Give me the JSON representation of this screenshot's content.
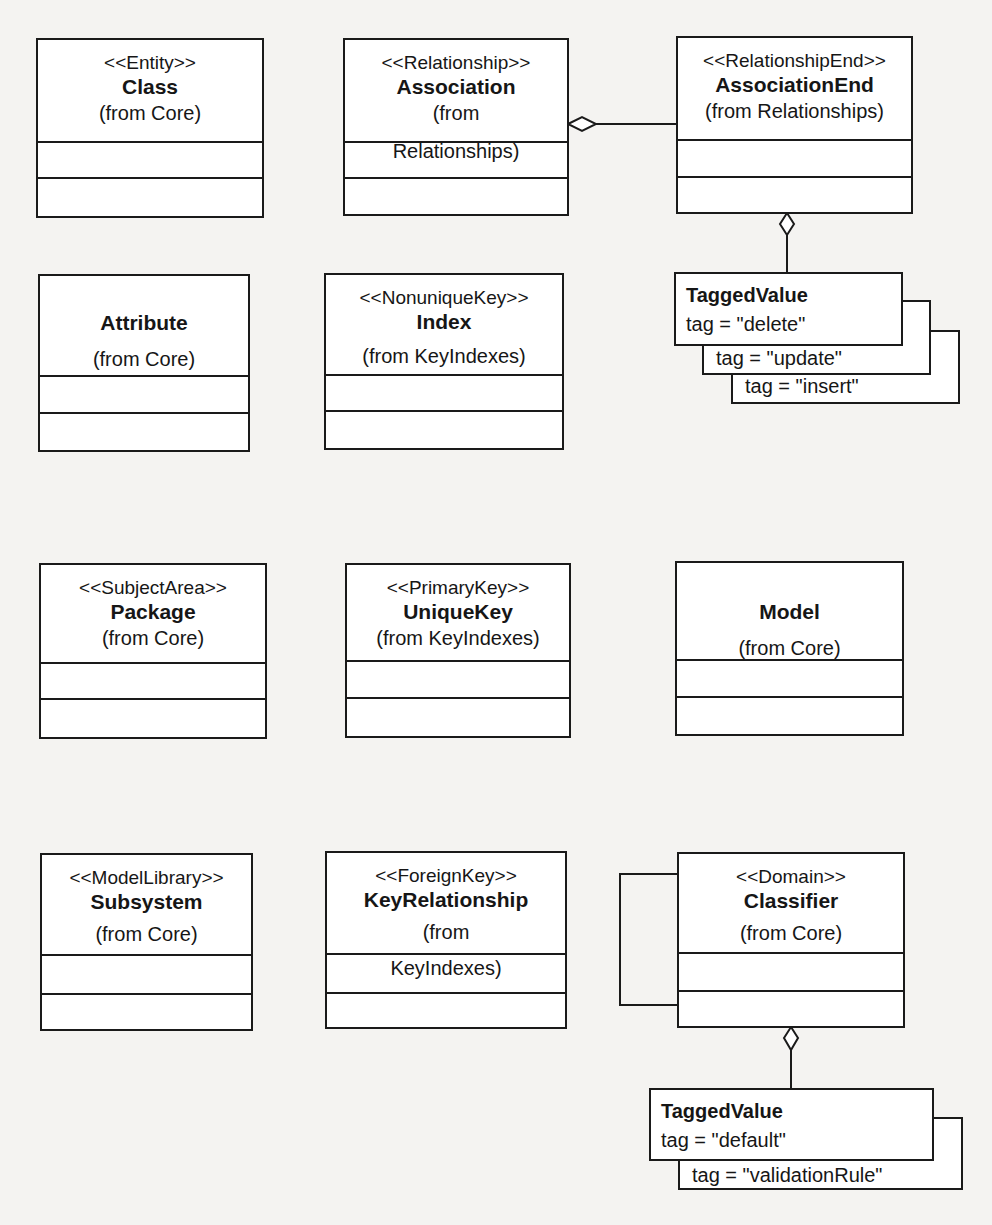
{
  "diagram": {
    "classes": [
      {
        "id": "class",
        "stereotype": "<<Entity>>",
        "name": "Class",
        "from": "(from Core)"
      },
      {
        "id": "association",
        "stereotype": "<<Relationship>>",
        "name": "Association",
        "from_line1": "(from",
        "from_line2": "Relationships)"
      },
      {
        "id": "association-end",
        "stereotype": "<<RelationshipEnd>>",
        "name": "AssociationEnd",
        "from": "(from Relationships)"
      },
      {
        "id": "attribute",
        "stereotype": "",
        "name": "Attribute",
        "from": "(from Core)"
      },
      {
        "id": "index",
        "stereotype": "<<NonuniqueKey>>",
        "name": "Index",
        "from": "(from KeyIndexes)"
      },
      {
        "id": "package",
        "stereotype": "<<SubjectArea>>",
        "name": "Package",
        "from": "(from Core)"
      },
      {
        "id": "unique-key",
        "stereotype": "<<PrimaryKey>>",
        "name": "UniqueKey",
        "from": "(from KeyIndexes)"
      },
      {
        "id": "model",
        "stereotype": "",
        "name": "Model",
        "from": "(from Core)"
      },
      {
        "id": "subsystem",
        "stereotype": "<<ModelLibrary>>",
        "name": "Subsystem",
        "from": "(from  Core)"
      },
      {
        "id": "key-relationship",
        "stereotype": "<<ForeignKey>>",
        "name": "KeyRelationship",
        "from_line1": "(from",
        "from_line2": "KeyIndexes)"
      },
      {
        "id": "classifier",
        "stereotype": "<<Domain>>",
        "name": "Classifier",
        "from": "(from Core)"
      }
    ],
    "tagged_values": [
      {
        "attached_to": "AssociationEnd",
        "name": "TaggedValue",
        "tags": [
          "tag  = \"delete\"",
          "tag = \"update\"",
          "tag = \"insert\""
        ]
      },
      {
        "attached_to": "Classifier",
        "name": "TaggedValue",
        "tags": [
          "tag = \"default\"",
          "tag = \"validationRule\""
        ]
      }
    ],
    "connectors": [
      {
        "from": "Association",
        "to": "AssociationEnd",
        "type": "aggregation",
        "diamond_at": "Association"
      },
      {
        "from": "AssociationEnd",
        "to": "TaggedValue",
        "type": "aggregation",
        "diamond_at": "AssociationEnd"
      },
      {
        "from": "Classifier",
        "to": "Classifier",
        "type": "self-association"
      },
      {
        "from": "Classifier",
        "to": "TaggedValue",
        "type": "aggregation",
        "diamond_at": "Classifier"
      }
    ],
    "colors": {
      "line": "#1a1a1a",
      "box_fill": "#ffffff",
      "background": "#f4f3f1"
    }
  }
}
